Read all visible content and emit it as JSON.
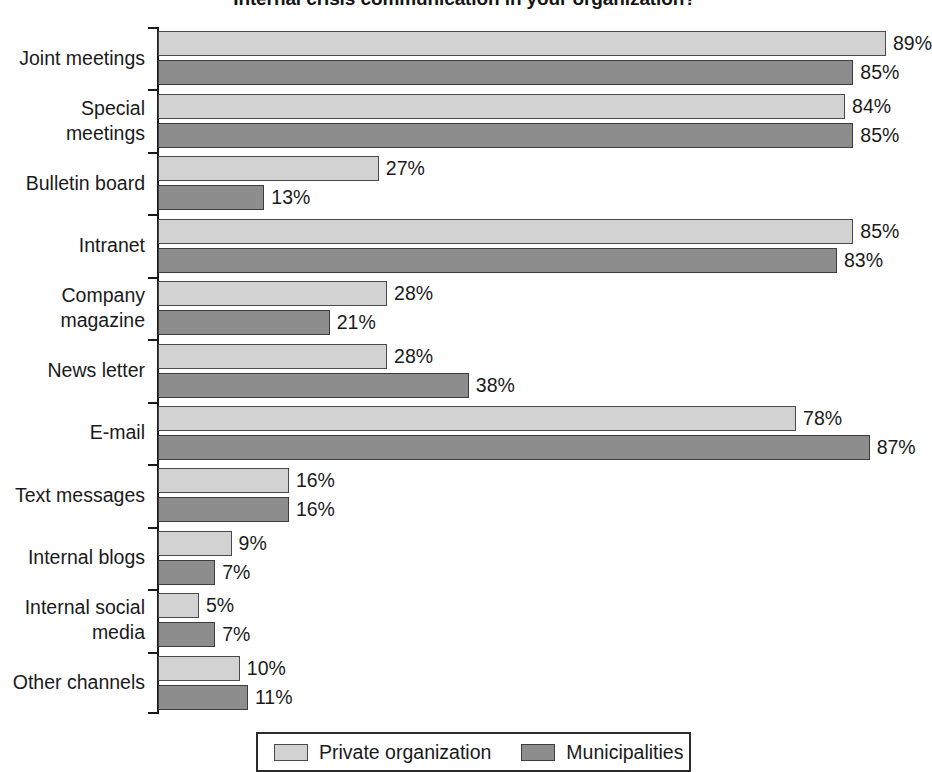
{
  "chart_data": {
    "type": "bar",
    "orientation": "horizontal",
    "title": "Internal crisis communication in your organization?",
    "xlabel": "",
    "ylabel": "",
    "xlim": [
      0,
      94
    ],
    "grid": false,
    "value_suffix": "%",
    "legend_position": "bottom",
    "categories": [
      "Joint meetings",
      "Special\nmeetings",
      "Bulletin board",
      "Intranet",
      "Company\nmagazine",
      "News letter",
      "E-mail",
      "Text messages",
      "Internal blogs",
      "Internal social\nmedia",
      "Other channels"
    ],
    "series": [
      {
        "name": "Private organization",
        "color": "#d2d2d2",
        "values": [
          89,
          84,
          27,
          85,
          28,
          28,
          78,
          16,
          9,
          5,
          10
        ],
        "labels": [
          "89%",
          "84%",
          "27%",
          "85%",
          "28%",
          "28%",
          "78%",
          "16%",
          "9%",
          "5%",
          "10%"
        ]
      },
      {
        "name": "Municipalities",
        "color": "#8d8d8d",
        "values": [
          85,
          85,
          13,
          83,
          21,
          38,
          87,
          16,
          7,
          7,
          11
        ],
        "labels": [
          "85%",
          "85%",
          "13%",
          "83%",
          "21%",
          "38%",
          "87%",
          "16%",
          "7%",
          "7%",
          "11%"
        ]
      }
    ]
  },
  "legend": {
    "items": [
      {
        "label": "Private organization",
        "color": "#d2d2d2"
      },
      {
        "label": "Municipalities",
        "color": "#8d8d8d"
      }
    ]
  }
}
